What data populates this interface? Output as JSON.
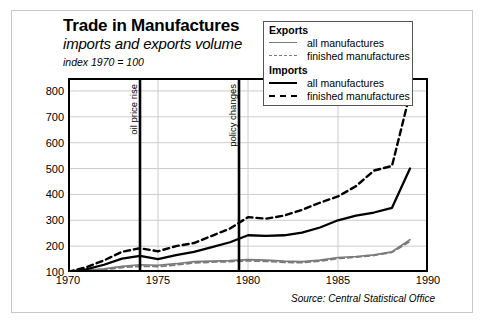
{
  "title": "Trade in Manufactures",
  "subtitle": "imports and exports volume",
  "index_note": "index 1970 = 100",
  "source": "Source: Central Statistical Office",
  "legend": {
    "exports_heading": "Exports",
    "imports_heading": "Imports",
    "exports_all": "all manufactures",
    "exports_finished": "finished manufactures",
    "imports_all": "all manufactures",
    "imports_finished": "finished manufactures"
  },
  "annotations": [
    {
      "label": "oil price rise",
      "x": 1974.0
    },
    {
      "label": "policy changes",
      "x": 1979.5
    }
  ],
  "colors": {
    "imports": "#000000",
    "exports": "#7a7a7a",
    "grid": "#cccccc",
    "axis": "#000000",
    "card_border": "#c8c8c8"
  },
  "chart_data": {
    "type": "line",
    "title": "Trade in Manufactures",
    "subtitle": "imports and exports volume",
    "xlabel": "",
    "ylabel": "index 1970 = 100",
    "xlim": [
      1970,
      1990
    ],
    "ylim": [
      100,
      850
    ],
    "yticks": [
      100,
      200,
      300,
      400,
      500,
      600,
      700,
      800
    ],
    "xticks": [
      1970,
      1975,
      1980,
      1985,
      1990
    ],
    "grid": true,
    "legend_position": "top-right",
    "x": [
      1970,
      1971,
      1972,
      1973,
      1974,
      1975,
      1976,
      1977,
      1978,
      1979,
      1980,
      1981,
      1982,
      1983,
      1984,
      1985,
      1986,
      1987,
      1988,
      1989
    ],
    "series": [
      {
        "name": "Imports: finished manufactures",
        "style": "dashed",
        "color": "#000000",
        "values": [
          100,
          118,
          145,
          178,
          192,
          180,
          200,
          212,
          240,
          268,
          312,
          306,
          318,
          340,
          368,
          392,
          432,
          492,
          510,
          545
        ]
      },
      {
        "name": "Imports: all manufactures",
        "style": "solid",
        "color": "#000000",
        "values": [
          100,
          110,
          128,
          152,
          162,
          150,
          165,
          178,
          196,
          215,
          242,
          240,
          242,
          252,
          272,
          300,
          318,
          330,
          348,
          392
        ]
      },
      {
        "name": "Exports: all manufactures",
        "style": "solid",
        "color": "#7a7a7a",
        "values": [
          100,
          106,
          112,
          122,
          128,
          126,
          132,
          140,
          142,
          144,
          148,
          146,
          142,
          140,
          146,
          156,
          160,
          166,
          178,
          196
        ]
      },
      {
        "name": "Exports: finished manufactures",
        "style": "dashed",
        "color": "#7a7a7a",
        "values": [
          100,
          104,
          109,
          117,
          122,
          121,
          127,
          135,
          138,
          140,
          143,
          141,
          137,
          136,
          142,
          152,
          157,
          164,
          176,
          194
        ]
      }
    ],
    "series_endpoints_note": {
      "imports_finished_1989": 790,
      "imports_all_1989": 500,
      "exports_all_1989": 225,
      "exports_finished_1989": 218
    },
    "annotation_lines": [
      {
        "label": "oil price rise",
        "x": 1974.0
      },
      {
        "label": "policy changes",
        "x": 1979.5
      }
    ]
  }
}
